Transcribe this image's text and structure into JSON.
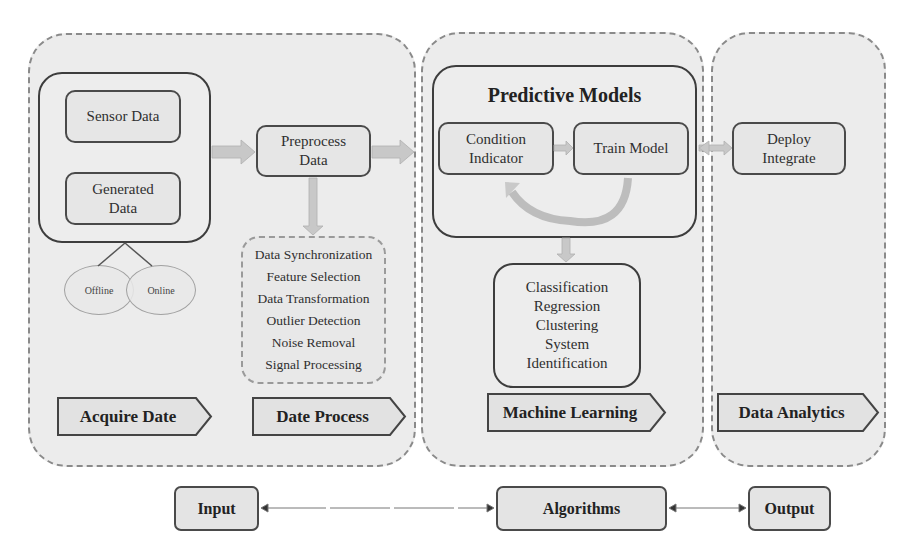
{
  "panels": {
    "acquire_process": {
      "acquire": {
        "sources": [
          "Sensor Data",
          "Generated Data"
        ],
        "modes": [
          "Offline",
          "Online"
        ],
        "stage_label": "Acquire Date"
      },
      "process": {
        "preprocess": "Preprocess Data",
        "steps": [
          "Data Synchronization",
          "Feature Selection",
          "Data Transformation",
          "Outlier Detection",
          "Noise Removal",
          "Signal Processing"
        ],
        "stage_label": "Date Process"
      }
    },
    "machine_learning": {
      "title": "Predictive Models",
      "condition_indicator": "Condition Indicator",
      "train_model": "Train Model",
      "tasks": [
        "Classification",
        "Regression",
        "Clustering",
        "System Identification"
      ],
      "stage_label": "Machine Learning"
    },
    "analytics": {
      "deploy": "Deploy Integrate",
      "stage_label": "Data Analytics"
    }
  },
  "bottom_row": {
    "input": "Input",
    "algorithms": "Algorithms",
    "output": "Output"
  },
  "colors": {
    "panel_fill": "#ececec",
    "panel_border": "#8a8a8a",
    "box_border": "#4a4a4a",
    "arrow_fill": "#c4c4c4"
  }
}
